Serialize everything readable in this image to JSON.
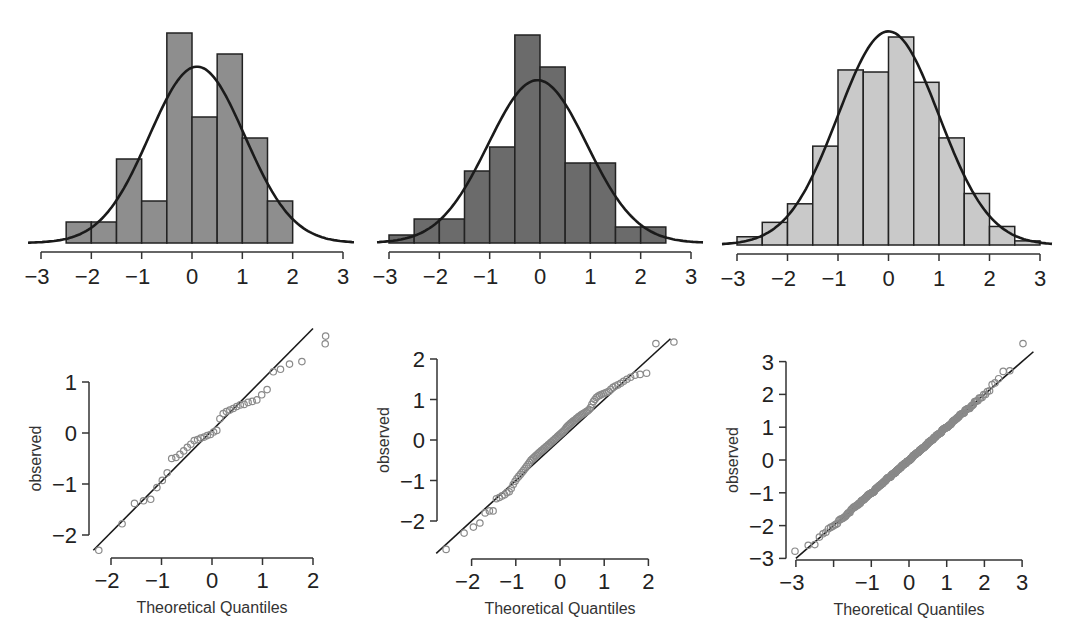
{
  "chart_data": [
    {
      "type": "bar",
      "id": "hist-1",
      "title": "",
      "xlabel": "",
      "ylabel": "",
      "bin_width": 0.5,
      "bin_edges": [
        -2.5,
        -2.0,
        -1.5,
        -1.0,
        -0.5,
        0.0,
        0.5,
        1.0,
        1.5,
        2.0
      ],
      "counts": [
        1,
        1,
        4,
        2,
        10,
        6,
        9,
        5,
        2
      ],
      "n": 40,
      "normal_curve": {
        "mean": 0.1,
        "sd": 0.95
      },
      "xlim": [
        -3,
        3
      ],
      "xticks": [
        "−3",
        "−2",
        "−1",
        "0",
        "1",
        "2",
        "3"
      ],
      "xtick_values": [
        -3,
        -2,
        -1,
        0,
        1,
        2,
        3
      ],
      "bar_color": "#8e8e8e",
      "frame": {
        "x_min_px": 41,
        "x_max_px": 343,
        "baseline_px": 243,
        "axis_px": 252,
        "max_bar_px": 210,
        "curve_start_px": 28,
        "curve_end_px": 355
      }
    },
    {
      "type": "bar",
      "id": "hist-2",
      "title": "",
      "xlabel": "",
      "ylabel": "",
      "bin_width": 0.5,
      "bin_edges": [
        -3.0,
        -2.5,
        -2.0,
        -1.5,
        -1.0,
        -0.5,
        0.0,
        0.5,
        1.0,
        1.5,
        2.0,
        2.5
      ],
      "counts": [
        1,
        3,
        3,
        9,
        12,
        26,
        22,
        10,
        10,
        2,
        2
      ],
      "n": 100,
      "normal_curve": {
        "mean": -0.05,
        "sd": 0.98
      },
      "xlim": [
        -3,
        3
      ],
      "xticks": [
        "−3",
        "−2",
        "−1",
        "0",
        "1",
        "2",
        "3"
      ],
      "xtick_values": [
        -3,
        -2,
        -1,
        0,
        1,
        2,
        3
      ],
      "bar_color": "#6b6b6b",
      "frame": {
        "x_min_px": 389,
        "x_max_px": 691,
        "baseline_px": 243,
        "axis_px": 252,
        "max_bar_px": 208,
        "curve_start_px": 377,
        "curve_end_px": 703
      }
    },
    {
      "type": "bar",
      "id": "hist-3",
      "title": "",
      "xlabel": "",
      "ylabel": "",
      "bin_width": 0.5,
      "bin_edges": [
        -3.0,
        -2.5,
        -2.0,
        -1.5,
        -1.0,
        -0.5,
        0.0,
        0.5,
        1.0,
        1.5,
        2.0,
        2.5,
        3.0
      ],
      "counts": [
        4,
        11,
        20,
        48,
        85,
        84,
        101,
        79,
        52,
        25,
        9,
        2
      ],
      "n": 520,
      "normal_curve": {
        "mean": 0.0,
        "sd": 1.0
      },
      "xlim": [
        -3,
        3
      ],
      "xticks": [
        "−3",
        "−2",
        "−1",
        "0",
        "1",
        "2",
        "3"
      ],
      "xtick_values": [
        -3,
        -2,
        -1,
        0,
        1,
        2,
        3
      ],
      "bar_color": "#c9c9c9",
      "frame": {
        "x_min_px": 737,
        "x_max_px": 1040,
        "baseline_px": 245,
        "axis_px": 254,
        "max_bar_px": 208,
        "curve_start_px": 722,
        "curve_end_px": 1052
      }
    },
    {
      "type": "scatter",
      "id": "qq-1",
      "title": "",
      "xlabel": "Theoretical Quantiles",
      "ylabel": "observed",
      "n": 40,
      "observed_sorted": [
        -2.3,
        -1.78,
        -1.38,
        -1.33,
        -1.3,
        -1.07,
        -0.93,
        -0.78,
        -0.5,
        -0.48,
        -0.42,
        -0.35,
        -0.28,
        -0.22,
        -0.15,
        -0.13,
        -0.1,
        -0.08,
        -0.05,
        -0.03,
        0.02,
        0.05,
        0.28,
        0.38,
        0.42,
        0.45,
        0.48,
        0.52,
        0.55,
        0.56,
        0.6,
        0.62,
        0.65,
        0.75,
        0.85,
        1.2,
        1.25,
        1.35,
        1.4,
        1.75
      ],
      "extra_outlier": {
        "x": 2.25,
        "y": 1.9
      },
      "line": {
        "intercept": 0.05,
        "slope": 1.0
      },
      "xlim": [
        -2.3,
        2.3
      ],
      "ylim": [
        -2.3,
        2.0
      ],
      "xticks": [
        "−2",
        "−1",
        "0",
        "1",
        "2"
      ],
      "xtick_values": [
        -2,
        -1,
        0,
        1,
        2
      ],
      "yticks": [
        "−2",
        "−1",
        "0",
        "1"
      ],
      "ytick_values": [
        -2,
        -1,
        0,
        1
      ],
      "frame": {
        "x0_px": 212,
        "x_per_unit": 50.5,
        "y0_px": 433,
        "y_per_unit": 51,
        "x_axis_px": 558,
        "y_axis_px": 89,
        "x_axis_from": -2,
        "x_axis_to": 2,
        "y_axis_from": -2,
        "y_axis_to": 1,
        "line_from": -2.35,
        "line_to": 2.0
      }
    },
    {
      "type": "scatter",
      "id": "qq-2",
      "title": "",
      "xlabel": "Theoretical Quantiles",
      "ylabel": "observed",
      "n": 100,
      "observed_sorted": [
        -2.7,
        -2.3,
        -2.15,
        -2.05,
        -1.8,
        -1.75,
        -1.75,
        -1.45,
        -1.42,
        -1.38,
        -1.35,
        -1.3,
        -1.28,
        -1.2,
        -1.1,
        -1.02,
        -0.95,
        -0.9,
        -0.85,
        -0.8,
        -0.75,
        -0.7,
        -0.65,
        -0.6,
        -0.55,
        -0.5,
        -0.47,
        -0.44,
        -0.41,
        -0.38,
        -0.35,
        -0.32,
        -0.3,
        -0.27,
        -0.25,
        -0.22,
        -0.2,
        -0.17,
        -0.15,
        -0.12,
        -0.1,
        -0.07,
        -0.05,
        -0.02,
        0.0,
        0.03,
        0.05,
        0.08,
        0.1,
        0.13,
        0.15,
        0.18,
        0.2,
        0.23,
        0.26,
        0.3,
        0.33,
        0.36,
        0.38,
        0.41,
        0.43,
        0.46,
        0.48,
        0.5,
        0.53,
        0.55,
        0.58,
        0.6,
        0.62,
        0.64,
        0.66,
        0.68,
        0.7,
        0.72,
        0.75,
        0.8,
        0.88,
        0.95,
        1.0,
        1.05,
        1.08,
        1.1,
        1.12,
        1.14,
        1.16,
        1.18,
        1.2,
        1.25,
        1.3,
        1.33,
        1.36,
        1.4,
        1.45,
        1.5,
        1.55,
        1.6,
        1.62,
        1.65,
        2.38,
        2.42
      ],
      "line": {
        "intercept": 0.0,
        "slope": 1.0
      },
      "xlim": [
        -2.6,
        2.5
      ],
      "ylim": [
        -2.8,
        2.5
      ],
      "xticks": [
        "−2",
        "−1",
        "0",
        "1",
        "2"
      ],
      "xtick_values": [
        -2,
        -1,
        0,
        1,
        2
      ],
      "yticks": [
        "−2",
        "−1",
        "0",
        "1",
        "2"
      ],
      "ytick_values": [
        -2,
        -1,
        0,
        1,
        2
      ],
      "frame": {
        "x0_px": 560,
        "x_per_unit": 44.2,
        "y0_px": 440,
        "y_per_unit": 40.5,
        "x_axis_px": 559,
        "y_axis_px": 437,
        "x_axis_from": -2,
        "x_axis_to": 2,
        "y_axis_from": -2,
        "y_axis_to": 2,
        "line_from": -2.8,
        "line_to": 2.5
      }
    },
    {
      "type": "scatter",
      "id": "qq-3",
      "title": "",
      "xlabel": "Theoretical Quantiles",
      "ylabel": "observed",
      "n": 400,
      "observed_model": {
        "noise_sd": 0.03,
        "low_tail": [
          -2.78,
          -2.6,
          -2.58,
          -2.35,
          -2.25,
          -2.2
        ],
        "high_tail": [
          2.3,
          2.35,
          2.48,
          2.7,
          2.72,
          3.55
        ]
      },
      "line": {
        "intercept": 0.0,
        "slope": 1.0
      },
      "xlim": [
        -3.1,
        3.2
      ],
      "ylim": [
        -3.1,
        3.6
      ],
      "xticks": [
        "−3",
        "",
        "−1",
        "0",
        "1",
        "2",
        "3"
      ],
      "xtick_values": [
        -3,
        -2,
        -1,
        0,
        1,
        2,
        3
      ],
      "yticks": [
        "−3",
        "−2",
        "−1",
        "0",
        "1",
        "2",
        "3"
      ],
      "ytick_values": [
        -3,
        -2,
        -1,
        0,
        1,
        2,
        3
      ],
      "frame": {
        "x0_px": 909,
        "x_per_unit": 37.7,
        "y0_px": 460,
        "y_per_unit": 32.8,
        "x_axis_px": 560,
        "y_axis_px": 786,
        "x_axis_from": -3,
        "x_axis_to": 3,
        "y_axis_from": -3,
        "y_axis_to": 3,
        "line_from": -3.0,
        "line_to": 3.3
      }
    }
  ],
  "labels": {
    "qq_xlabel": "Theoretical Quantiles",
    "qq_ylabel": "observed"
  },
  "colors": {
    "curve": "#1a1a1a",
    "bar_edge": "#222222",
    "axis": "#333333",
    "qq_point": "#8a8a8a",
    "qq_line": "#1a1a1a"
  }
}
